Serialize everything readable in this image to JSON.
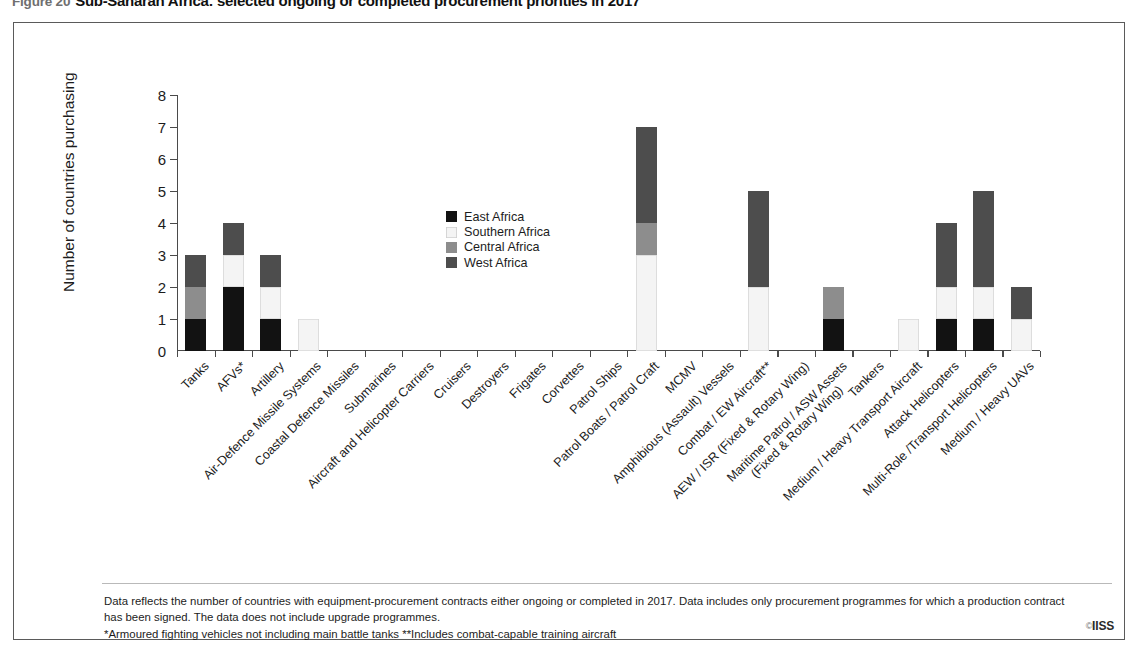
{
  "figure": {
    "number": "Figure 20",
    "title": "Sub-Saharan Africa: selected ongoing or completed procurement priorities in 2017"
  },
  "credit": {
    "symbol": "©",
    "label": "IISS"
  },
  "footnote": {
    "line1": "Data reflects the number of countries with equipment-procurement contracts either ongoing or completed in 2017. Data includes only procurement programmes for which a production contract",
    "line2": "has been signed. The data does not include upgrade programmes.",
    "line3": "*Armoured fighting vehicles not including main battle tanks  **Includes combat-capable training aircraft"
  },
  "colors": {
    "east_africa": "#121212",
    "southern_africa": "#f4f4f4",
    "central_africa": "#8d8d8d",
    "west_africa": "#4d4d4d",
    "axis": "#4a4a4a",
    "text": "#1c1c1c",
    "frame": "#5a5a5a"
  },
  "chart_data": {
    "type": "bar",
    "stacked": true,
    "title": "Sub-Saharan Africa: selected ongoing or completed procurement priorities in 2017",
    "xlabel": "",
    "ylabel": "Number of countries purchasing",
    "ylim": [
      0,
      8
    ],
    "yticks": [
      0,
      1,
      2,
      3,
      4,
      5,
      6,
      7,
      8
    ],
    "grid": false,
    "legend_position": "inside-upper-center",
    "categories": [
      "Tanks",
      "AFVs*",
      "Artillery",
      "Air-Defence Missile Systems",
      "Coastal Defence Missiles",
      "Submarines",
      "Aircraft and Helicopter Carriers",
      "Cruisers",
      "Destroyers",
      "Frigates",
      "Corvettes",
      "Patrol Ships",
      "Patrol Boats / Patrol Craft",
      "MCMV",
      "Amphibious (Assault) Vessels",
      "Combat / EW Aircraft**",
      "AEW / ISR (Fixed & Rotary Wing)",
      "Maritime Patrol / ASW Assets (Fixed & Rotary Wing)",
      "Tankers",
      "Medium / Heavy Transport Aircraft",
      "Attack Helicopters",
      "Multi-Role /Transport Helicopters",
      "Medium / Heavy UAVs"
    ],
    "categories_wrapped": [
      [
        "Tanks",
        ""
      ],
      [
        "AFVs*",
        ""
      ],
      [
        "Artillery",
        ""
      ],
      [
        "Air-Defence Missile Systems",
        ""
      ],
      [
        "Coastal Defence Missiles",
        ""
      ],
      [
        "Submarines",
        ""
      ],
      [
        "Aircraft and Helicopter Carriers",
        ""
      ],
      [
        "Cruisers",
        ""
      ],
      [
        "Destroyers",
        ""
      ],
      [
        "Frigates",
        ""
      ],
      [
        "Corvettes",
        ""
      ],
      [
        "Patrol Ships",
        ""
      ],
      [
        "Patrol Boats / Patrol Craft",
        ""
      ],
      [
        "MCMV",
        ""
      ],
      [
        "Amphibious (Assault) Vessels",
        ""
      ],
      [
        "Combat / EW Aircraft**",
        ""
      ],
      [
        "AEW / ISR (Fixed & Rotary Wing)",
        ""
      ],
      [
        "Maritime Patrol / ASW Assets",
        "(Fixed & Rotary Wing)"
      ],
      [
        "Tankers",
        ""
      ],
      [
        "Medium / Heavy Transport Aircraft",
        ""
      ],
      [
        "Attack Helicopters",
        ""
      ],
      [
        "Multi-Role /Transport Helicopters",
        ""
      ],
      [
        "Medium / Heavy UAVs",
        ""
      ]
    ],
    "series": [
      {
        "name": "East Africa",
        "color": "#121212",
        "values": [
          1,
          2,
          1,
          0,
          0,
          0,
          0,
          0,
          0,
          0,
          0,
          0,
          0,
          0,
          0,
          0,
          0,
          1,
          0,
          0,
          1,
          1,
          0
        ]
      },
      {
        "name": "Southern Africa",
        "color": "#f4f4f4",
        "values": [
          0,
          1,
          1,
          1,
          0,
          0,
          0,
          0,
          0,
          0,
          0,
          0,
          3,
          0,
          0,
          2,
          0,
          0,
          0,
          1,
          1,
          1,
          1
        ]
      },
      {
        "name": "Central Africa",
        "color": "#8d8d8d",
        "values": [
          1,
          0,
          0,
          0,
          0,
          0,
          0,
          0,
          0,
          0,
          0,
          0,
          1,
          0,
          0,
          0,
          0,
          1,
          0,
          0,
          0,
          0,
          0
        ]
      },
      {
        "name": "West Africa",
        "color": "#4d4d4d",
        "values": [
          1,
          1,
          1,
          0,
          0,
          0,
          0,
          0,
          0,
          0,
          0,
          0,
          3,
          0,
          0,
          3,
          0,
          0,
          0,
          0,
          2,
          3,
          1
        ]
      }
    ],
    "totals": [
      3,
      4,
      3,
      1,
      0,
      0,
      0,
      0,
      0,
      0,
      0,
      0,
      7,
      0,
      0,
      5,
      0,
      2,
      0,
      1,
      4,
      5,
      2
    ]
  }
}
